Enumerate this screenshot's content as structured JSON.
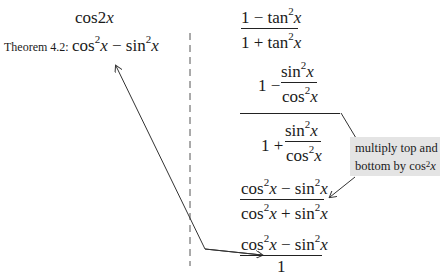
{
  "left_column": {
    "heading": {
      "fn": "cos",
      "arg": "2",
      "var": "x"
    },
    "theorem_label": "Theorem 4.2:",
    "theorem_expr": {
      "t1": "cos",
      "p1": "2",
      "v1": "x",
      "op": " − ",
      "t2": "sin",
      "p2": "2",
      "v2": "x"
    }
  },
  "right_column": {
    "step1": {
      "num": {
        "a": "1 − tan",
        "p": "2",
        "v": "x"
      },
      "den": {
        "a": "1 + tan",
        "p": "2",
        "v": "x"
      }
    },
    "step2": {
      "num_prefix": "1 −",
      "den_prefix": "1 +",
      "inner_num": {
        "a": "sin",
        "p": "2",
        "v": "x"
      },
      "inner_den": {
        "a": "cos",
        "p": "2",
        "v": "x"
      }
    },
    "step3": {
      "num": {
        "a": "cos",
        "p1": "2",
        "v1": "x",
        "op": " − sin",
        "p2": "2",
        "v2": "x"
      },
      "den": {
        "a": "cos",
        "p1": "2",
        "v1": "x",
        "op": " + sin",
        "p2": "2",
        "v2": "x"
      }
    },
    "step4": {
      "num": {
        "a": "cos",
        "p1": "2",
        "v1": "x",
        "op": " − sin",
        "p2": "2",
        "v2": "x"
      },
      "den": "1"
    }
  },
  "callout": {
    "line1": "multiply top and",
    "line2_prefix": "bottom by cos",
    "line2_power": "2",
    "line2_var": "x"
  },
  "colors": {
    "ink": "#1a1a1a",
    "callout_bg": "#e4e4e4",
    "lines": "#444444"
  }
}
